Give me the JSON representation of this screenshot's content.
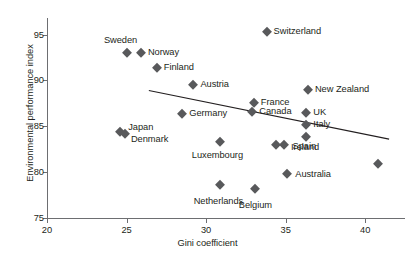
{
  "chart_data": {
    "type": "scatter",
    "title": "",
    "xlabel": "Gini coefficient",
    "ylabel": "Environmental performance index",
    "xlim": [
      20,
      42.5
    ],
    "ylim": [
      75,
      96.8
    ],
    "xticks": [
      20,
      25,
      30,
      35,
      40
    ],
    "yticks": [
      75,
      80,
      85,
      90,
      95
    ],
    "grid": false,
    "legend": "none",
    "marker_shape": "diamond",
    "marker_color": "#58595b",
    "axis_color": "#6d6e71",
    "text_color": "#231f20",
    "points": [
      {
        "label": "Sweden",
        "x": 25.0,
        "y": 93.0,
        "label_dx": -6,
        "label_dy": -13,
        "label_align": "center"
      },
      {
        "label": "Norway",
        "x": 25.9,
        "y": 93.0,
        "label_dx": 7,
        "label_dy": -1,
        "label_align": "left"
      },
      {
        "label": "Finland",
        "x": 26.9,
        "y": 91.3,
        "label_dx": 7,
        "label_dy": -1,
        "label_align": "left"
      },
      {
        "label": "Austria",
        "x": 29.2,
        "y": 89.5,
        "label_dx": 7,
        "label_dy": -1,
        "label_align": "left"
      },
      {
        "label": "Switzerland",
        "x": 33.8,
        "y": 95.3,
        "label_dx": 7,
        "label_dy": -1,
        "label_align": "left"
      },
      {
        "label": "New Zealand",
        "x": 36.4,
        "y": 88.9,
        "label_dx": 7,
        "label_dy": -1,
        "label_align": "left"
      },
      {
        "label": "Germany",
        "x": 28.5,
        "y": 86.3,
        "label_dx": 7,
        "label_dy": -1,
        "label_align": "left"
      },
      {
        "label": "France",
        "x": 33.0,
        "y": 87.5,
        "label_dx": 7,
        "label_dy": -1,
        "label_align": "left"
      },
      {
        "label": "Canada",
        "x": 32.9,
        "y": 86.5,
        "label_dx": 7,
        "label_dy": -1,
        "label_align": "left"
      },
      {
        "label": "UK",
        "x": 36.3,
        "y": 86.4,
        "label_dx": 7,
        "label_dy": -1,
        "label_align": "left"
      },
      {
        "label": "Italy",
        "x": 36.3,
        "y": 85.1,
        "label_dx": 7,
        "label_dy": -1,
        "label_align": "left"
      },
      {
        "label": "Japan",
        "x": 24.6,
        "y": 84.4,
        "label_dx": 8,
        "label_dy": -5,
        "label_align": "left"
      },
      {
        "label": "Denmark",
        "x": 24.9,
        "y": 84.2,
        "label_dx": 6,
        "label_dy": 5,
        "label_align": "left"
      },
      {
        "label": "Spain",
        "x": 36.3,
        "y": 83.8,
        "label_dx": -2,
        "label_dy": 9,
        "label_align": "center"
      },
      {
        "label": "Ireland",
        "x": 34.9,
        "y": 83.0,
        "label_dx": 7,
        "label_dy": 2,
        "label_align": "left"
      },
      {
        "label": "",
        "x": 34.4,
        "y": 83.0,
        "label_dx": 0,
        "label_dy": 0,
        "label_align": "left"
      },
      {
        "label": "Luxembourg",
        "x": 30.9,
        "y": 83.3,
        "label_dx": -3,
        "label_dy": 13,
        "label_align": "center"
      },
      {
        "label": "Australia",
        "x": 35.1,
        "y": 79.8,
        "label_dx": 8,
        "label_dy": 0,
        "label_align": "left"
      },
      {
        "label": "Netherlands",
        "x": 30.9,
        "y": 78.6,
        "label_dx": -2,
        "label_dy": 16,
        "label_align": "center"
      },
      {
        "label": "Belgium",
        "x": 33.1,
        "y": 78.2,
        "label_dx": 0,
        "label_dy": 16,
        "label_align": "center"
      },
      {
        "label": "",
        "x": 40.8,
        "y": 80.9,
        "label_dx": 0,
        "label_dy": 0,
        "label_align": "left"
      }
    ],
    "trend_line": {
      "x0": 26.4,
      "y0": 88.9,
      "x1": 41.5,
      "y1": 83.6,
      "color": "#231f20"
    }
  }
}
